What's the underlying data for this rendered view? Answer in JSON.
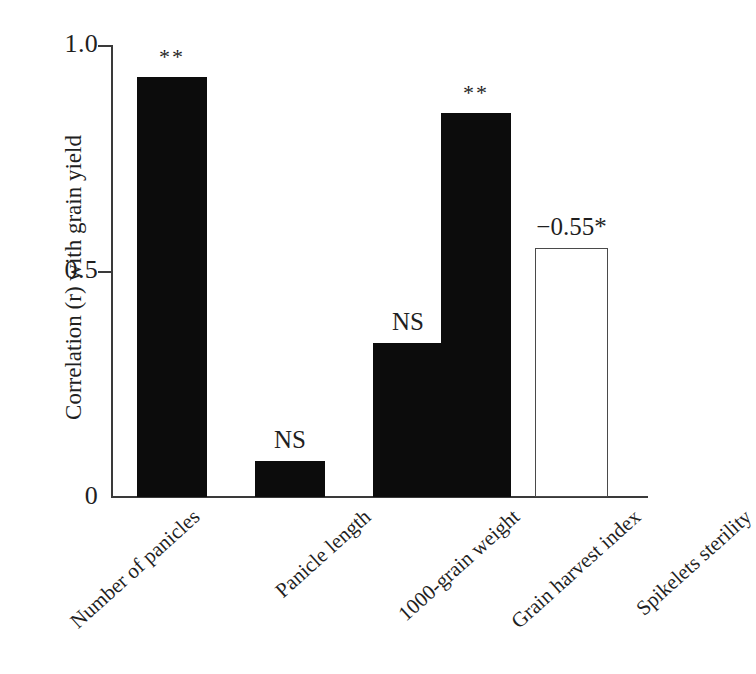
{
  "chart_data": {
    "type": "bar",
    "title": "",
    "subtitle": "",
    "xlabel": "",
    "ylabel": "Correlation (r) with grain yield",
    "ylim": [
      0,
      1.0
    ],
    "yticks": [
      "0",
      "0.5",
      "1.0"
    ],
    "ytick_values": [
      0,
      0.5,
      1.0
    ],
    "grid": false,
    "legend": "none",
    "categories": [
      "Number of panicles",
      "Panicle length",
      "1000-grain weight",
      "Grain harvest index",
      "Spikelets sterility"
    ],
    "values": [
      0.93,
      0.08,
      0.34,
      0.85,
      0.55
    ],
    "signed_values": [
      0.93,
      0.08,
      0.34,
      0.85,
      -0.55
    ],
    "annotations": [
      "**",
      "NS",
      "NS",
      "**",
      "−0.55*"
    ],
    "bar_styles": [
      "filled",
      "filled",
      "filled",
      "filled",
      "hollow"
    ],
    "colors": {
      "bar_fill": "#0c0c0c",
      "bar_outline": "#4a4a4a",
      "axis": "#3a3a3a",
      "text": "#1f1f1f",
      "background": "#ffffff"
    }
  },
  "axis": {
    "y_title": "Correlation (r) with grain yield",
    "ticks": {
      "top": "1.0",
      "middle": "0.5",
      "bottom": "0"
    }
  },
  "bars": [
    {
      "category": "Number of panicles",
      "value": 0.93,
      "annotation": "**",
      "style": "filled"
    },
    {
      "category": "Panicle length",
      "value": 0.08,
      "annotation": "NS",
      "style": "filled"
    },
    {
      "category": "1000-grain weight",
      "value": 0.34,
      "annotation": "NS",
      "style": "filled"
    },
    {
      "category": "Grain harvest index",
      "value": 0.85,
      "annotation": "**",
      "style": "filled"
    },
    {
      "category": "Spikelets sterility",
      "value": 0.55,
      "annotation": "−0.55*",
      "style": "hollow"
    }
  ]
}
